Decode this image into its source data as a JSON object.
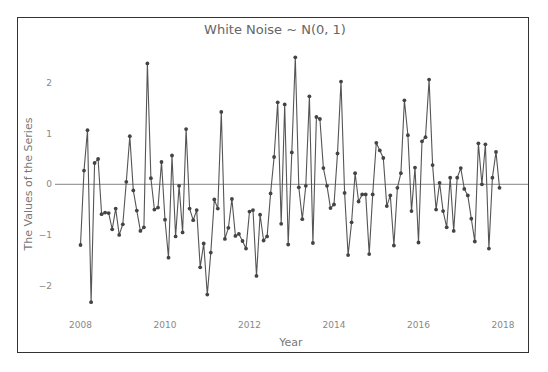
{
  "chart_data": {
    "type": "line",
    "title": "White Noise ~ N(0, 1)",
    "xlabel": "Year",
    "ylabel": "The Values of the Series",
    "x_tick_labels": [
      "2008",
      "2010",
      "2012",
      "2014",
      "2016",
      "2018"
    ],
    "x_tick_values": [
      2008,
      2010,
      2012,
      2014,
      2016,
      2018
    ],
    "y_tick_labels": [
      "−2",
      "−1",
      "0",
      "1",
      "2"
    ],
    "y_tick_values": [
      -2,
      -1,
      0,
      1,
      2
    ],
    "xlim": [
      2007.95,
      2019.1
    ],
    "ylim": [
      -2.8,
      2.65
    ],
    "grid": false,
    "zero_line": true,
    "legend": null,
    "series": [
      {
        "name": "White Noise",
        "x_start": 2008.0,
        "x_step_months": 1,
        "marker": "circle",
        "color": "#555555",
        "values": [
          -1.2,
          0.27,
          1.07,
          -2.33,
          0.42,
          0.5,
          -0.59,
          -0.56,
          -0.57,
          -0.89,
          -0.48,
          -1.0,
          -0.79,
          0.05,
          0.95,
          -0.12,
          -0.52,
          -0.92,
          -0.85,
          2.39,
          0.12,
          -0.5,
          -0.46,
          0.44,
          -0.7,
          -1.45,
          0.57,
          -1.03,
          -0.03,
          -0.95,
          1.09,
          -0.48,
          -0.71,
          -0.51,
          -1.64,
          -1.17,
          -2.18,
          -1.35,
          -0.3,
          -0.48,
          1.43,
          -1.08,
          -0.86,
          -0.29,
          -1.02,
          -0.98,
          -1.12,
          -1.27,
          -0.54,
          -0.51,
          -1.81,
          -0.6,
          -1.11,
          -1.03,
          -0.18,
          0.54,
          1.62,
          -0.78,
          1.58,
          -1.19,
          0.63,
          2.51,
          -0.06,
          -0.69,
          -0.03,
          1.74,
          -1.16,
          1.33,
          1.29,
          0.32,
          -0.03,
          -0.47,
          -0.4,
          0.61,
          2.03,
          -0.17,
          -1.4,
          -0.75,
          0.22,
          -0.34,
          -0.2,
          -0.2,
          -1.38,
          -0.2,
          0.82,
          0.67,
          0.52,
          -0.43,
          -0.22,
          -1.21,
          -0.07,
          0.22,
          1.66,
          0.97,
          -0.53,
          0.33,
          -1.15,
          0.85,
          0.93,
          2.07,
          0.38,
          -0.5,
          0.03,
          -0.53,
          -0.85,
          0.13,
          -0.92,
          0.13,
          0.32,
          -0.09,
          -0.22,
          -0.68,
          -1.13,
          0.81,
          0.0,
          0.79,
          -1.27,
          0.13,
          0.64,
          -0.07
        ]
      }
    ]
  },
  "colors": {
    "line": "#555555",
    "marker": "#444444",
    "zero_line": "#777777",
    "frame": "#333333",
    "title": "#666666",
    "labels": "#888888"
  }
}
